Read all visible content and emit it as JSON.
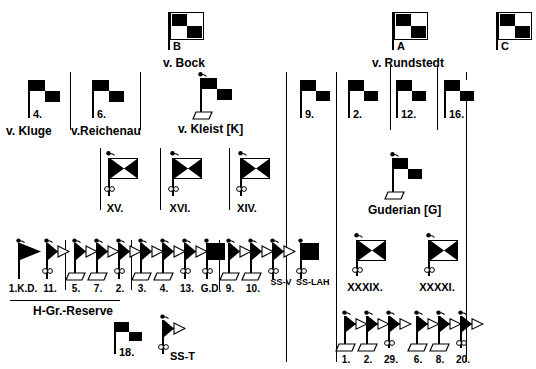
{
  "diagram": {
    "ink_color": "#000000",
    "paper_color": "#ffffff"
  },
  "army_groups": [
    {
      "id": "B",
      "designation": "B",
      "commander": "v. Bock",
      "symbol": "checkerboard-flag-boxed"
    },
    {
      "id": "A",
      "designation": "A",
      "commander": "v. Rundstedt",
      "symbol": "checkerboard-flag-boxed"
    },
    {
      "id": "C",
      "designation": "C",
      "commander": "",
      "symbol": "checkerboard-flag-boxed"
    }
  ],
  "armies": [
    {
      "id": "army-4",
      "designation": "4.",
      "commander": "v. Kluge",
      "symbol": "checkerboard-flag"
    },
    {
      "id": "army-6",
      "designation": "6.",
      "commander": "v.Reichenau",
      "symbol": "checkerboard-flag"
    },
    {
      "id": "army-9",
      "designation": "9.",
      "commander": "",
      "symbol": "checkerboard-flag"
    },
    {
      "id": "army-2",
      "designation": "2.",
      "commander": "",
      "symbol": "checkerboard-flag"
    },
    {
      "id": "army-12",
      "designation": "12.",
      "commander": "",
      "symbol": "checkerboard-flag"
    },
    {
      "id": "army-16",
      "designation": "16.",
      "commander": "",
      "symbol": "checkerboard-flag"
    },
    {
      "id": "army-18",
      "designation": "18.",
      "commander": "",
      "symbol": "checkerboard-flag"
    }
  ],
  "panzer_groups": [
    {
      "id": "pg-kleist",
      "designation": "",
      "commander": "v. Kleist [K]",
      "symbol": "checkerboard-flag-tracked"
    },
    {
      "id": "pg-guderian",
      "designation": "",
      "commander": "Guderian [G]",
      "symbol": "checkerboard-flag-tracked"
    }
  ],
  "corps": [
    {
      "id": "corps-xv",
      "designation": "XV.",
      "symbol": "corps-flag-motorized"
    },
    {
      "id": "corps-xvi",
      "designation": "XVI.",
      "symbol": "corps-flag-motorized"
    },
    {
      "id": "corps-xiv",
      "designation": "XIV.",
      "symbol": "corps-flag-motorized"
    },
    {
      "id": "corps-xxxix",
      "designation": "XXXIX.",
      "symbol": "corps-flag-motorized"
    },
    {
      "id": "corps-xxxxi",
      "designation": "XXXXI.",
      "symbol": "corps-flag-motorized"
    }
  ],
  "division_groups": [
    {
      "id": "group-hgr-reserve",
      "parent": "army-group-reserve",
      "caption": "H-Gr.-Reserve",
      "units": [
        {
          "designation": "1.K.D.",
          "symbol": "pennant"
        },
        {
          "designation": "11.",
          "symbol": "pennant-motorized"
        }
      ]
    },
    {
      "id": "group-xv",
      "parent": "corps-xv",
      "caption": "",
      "units": [
        {
          "designation": "5.",
          "symbol": "pennant-panzer"
        },
        {
          "designation": "7.",
          "symbol": "pennant-panzer"
        },
        {
          "designation": "2.",
          "symbol": "pennant-motorized"
        }
      ]
    },
    {
      "id": "group-xvi",
      "parent": "corps-xvi",
      "caption": "",
      "units": [
        {
          "designation": "3.",
          "symbol": "pennant-panzer"
        },
        {
          "designation": "4.",
          "symbol": "pennant-panzer"
        },
        {
          "designation": "13.",
          "symbol": "pennant-motorized"
        },
        {
          "designation": "G.D.",
          "symbol": "solid-flag-motorized"
        }
      ]
    },
    {
      "id": "group-xiv",
      "parent": "corps-xiv",
      "caption": "",
      "units": [
        {
          "designation": "9.",
          "symbol": "pennant-panzer"
        },
        {
          "designation": "10.",
          "symbol": "pennant-panzer"
        },
        {
          "designation": "SS-V",
          "symbol": "pennant-motorized"
        },
        {
          "designation": "SS-LAH",
          "symbol": "solid-flag-motorized"
        }
      ]
    },
    {
      "id": "group-xxxix",
      "parent": "corps-xxxix",
      "caption": "",
      "units": [
        {
          "designation": "1.",
          "symbol": "pennant-panzer"
        },
        {
          "designation": "2.",
          "symbol": "pennant-panzer"
        },
        {
          "designation": "29.",
          "symbol": "pennant-motorized"
        }
      ]
    },
    {
      "id": "group-xxxxi",
      "parent": "corps-xxxxi",
      "caption": "",
      "units": [
        {
          "designation": "6.",
          "symbol": "pennant-panzer"
        },
        {
          "designation": "8.",
          "symbol": "pennant-panzer"
        },
        {
          "designation": "20.",
          "symbol": "pennant-motorized"
        }
      ]
    }
  ],
  "independent_units": [
    {
      "id": "unit-ss-t",
      "designation": "SS-T",
      "symbol": "pennant-motorized"
    }
  ],
  "labels": {
    "hgr_reserve": "H-Gr.-Reserve"
  }
}
